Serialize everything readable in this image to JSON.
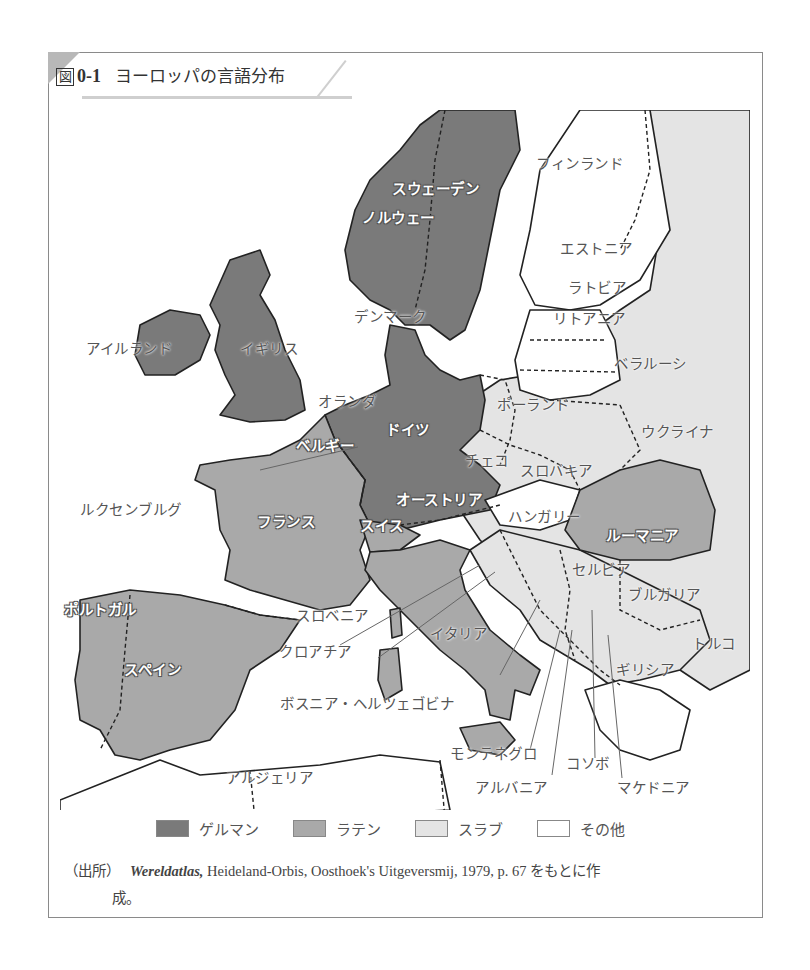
{
  "figure": {
    "number_prefix": "図",
    "number": "0-1",
    "title": "ヨーロッパの言語分布"
  },
  "colors": {
    "germanic": "#7a7a7a",
    "latin": "#a9a9a9",
    "slavic": "#e4e4e4",
    "other": "#ffffff",
    "border": "#222222",
    "frame": "#8a8a8a"
  },
  "legend": [
    {
      "key": "germanic",
      "label": "ゲルマン",
      "color": "#7a7a7a"
    },
    {
      "key": "latin",
      "label": "ラテン",
      "color": "#a9a9a9"
    },
    {
      "key": "slavic",
      "label": "スラブ",
      "color": "#e4e4e4"
    },
    {
      "key": "other",
      "label": "その他",
      "color": "#ffffff"
    }
  ],
  "labels": {
    "sweden": "スウェーデン",
    "norway": "ノルウェー",
    "finland": "フィンランド",
    "estonia": "エストニア",
    "latvia": "ラトビア",
    "lithuania": "リトアニア",
    "denmark": "デンマーク",
    "ireland": "アイルランド",
    "uk": "イギリス",
    "belarus": "ベラルーシ",
    "netherlands": "オランダ",
    "poland": "ポーランド",
    "germany": "ドイツ",
    "belgium": "ベルギー",
    "ukraine": "ウクライナ",
    "czech": "チェコ",
    "slovakia": "スロバキア",
    "luxembourg": "ルクセンブルグ",
    "austria": "オーストリア",
    "hungary": "ハンガリー",
    "france": "フランス",
    "switzerland": "スイス",
    "romania": "ルーマニア",
    "serbia": "セルビア",
    "bulgaria": "ブルガリア",
    "portugal": "ポルトガル",
    "slovenia": "スロベニア",
    "italy": "イタリア",
    "turkey": "トルコ",
    "croatia": "クロアチア",
    "greece": "ギリシア",
    "spain": "スペイン",
    "bosnia": "ボスニア・ヘルツェゴビナ",
    "montenegro": "モンテネグロ",
    "kosovo": "コソボ",
    "albania": "アルバニア",
    "macedonia": "マケドニア",
    "algeria": "アルジェリア"
  },
  "source": {
    "tag": "（出所）",
    "title": "Wereldatlas,",
    "rest": " Heideland-Orbis, Oosthoek's Uitgeversmij, 1979, p. 67 をもとに作",
    "continuation": "成。"
  }
}
